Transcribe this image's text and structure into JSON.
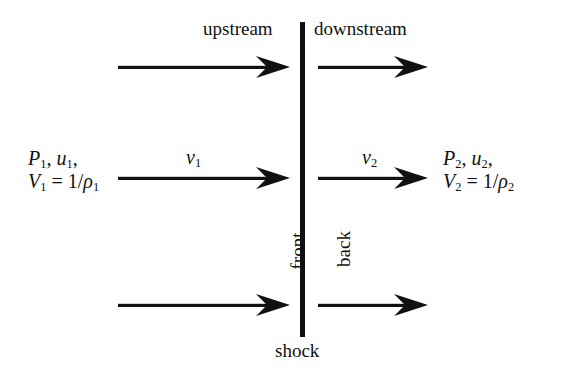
{
  "figure": {
    "background_color": "#ffffff",
    "ink_color": "#111111"
  },
  "shock_line": {
    "name": "shock-front-line",
    "x": 300,
    "y_top": 22,
    "y_bottom": 337,
    "thickness": 5,
    "color": "#111111"
  },
  "labels": {
    "upstream": "upstream",
    "downstream": "downstream",
    "front": "front",
    "back": "back",
    "shock": "shock",
    "v1_symbol": "v",
    "v1_sub": "1",
    "v2_symbol": "v",
    "v2_sub": "2"
  },
  "left_state": {
    "line1": {
      "p_symbol": "P",
      "p_sub": "1",
      "comma1": ", ",
      "u_symbol": "u",
      "u_sub": "1",
      "comma2": ","
    },
    "line2": {
      "v_symbol": "V",
      "v_sub": "1",
      "equals": " = 1/",
      "rho_symbol": "ρ",
      "rho_sub": "1"
    }
  },
  "right_state": {
    "line1": {
      "p_symbol": "P",
      "p_sub": "2",
      "comma1": ", ",
      "u_symbol": "u",
      "u_sub": "2",
      "comma2": ","
    },
    "line2": {
      "v_symbol": "V",
      "v_sub": "2",
      "equals": " = 1/",
      "rho_symbol": "ρ",
      "rho_sub": "2"
    }
  },
  "arrows": {
    "upstream_rows": [
      {
        "name": "upstream-arrow-top",
        "x": 118,
        "y": 67,
        "length": 172
      },
      {
        "name": "upstream-arrow-middle",
        "x": 118,
        "y": 178,
        "length": 172
      },
      {
        "name": "upstream-arrow-bottom",
        "x": 118,
        "y": 305,
        "length": 172
      }
    ],
    "downstream_rows": [
      {
        "name": "downstream-arrow-top",
        "x": 318,
        "y": 67,
        "length": 110
      },
      {
        "name": "downstream-arrow-middle",
        "x": 318,
        "y": 178,
        "length": 110
      },
      {
        "name": "downstream-arrow-bottom",
        "x": 318,
        "y": 305,
        "length": 110
      }
    ],
    "direction": "left-to-right",
    "color": "#111111"
  }
}
